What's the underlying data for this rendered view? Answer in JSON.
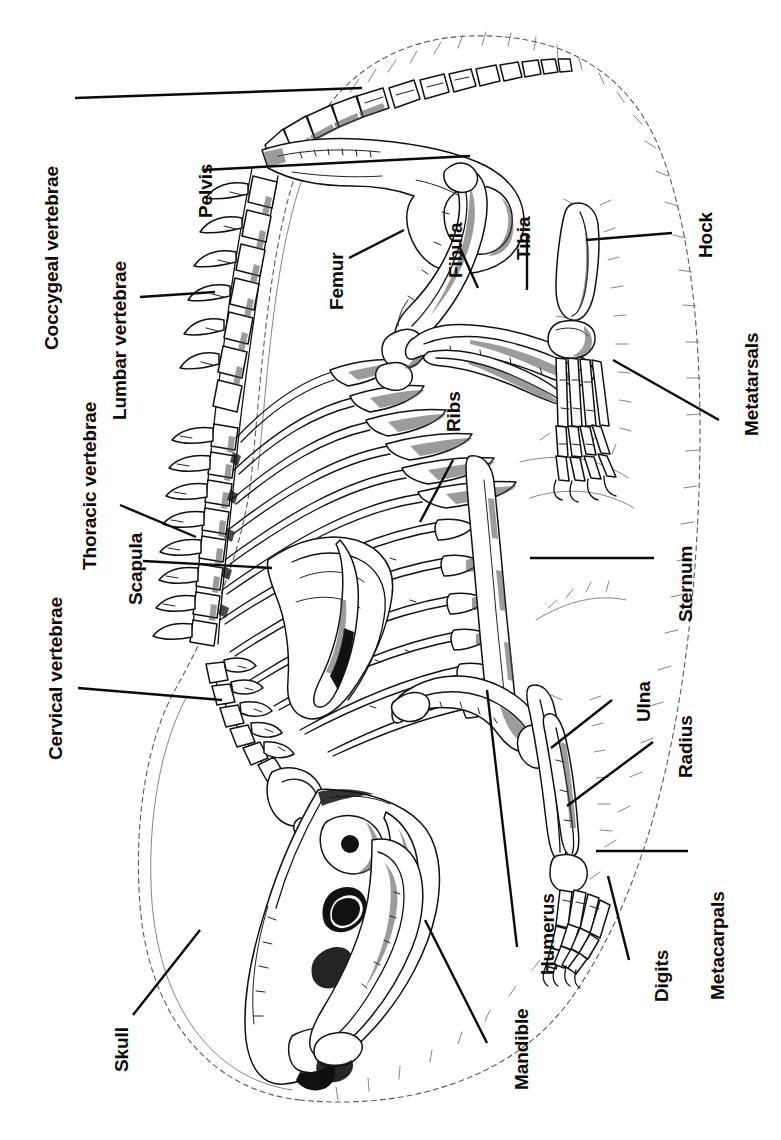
{
  "figure": {
    "view": "lateral",
    "orientation_note": "Labels rendered rotated 90 degrees counter-clockwise",
    "line_color": "#000000",
    "background_color": "#ffffff",
    "label_color": "#0a0a0a"
  },
  "labels": [
    {
      "id": "coccygeal-vertebrae",
      "text": "Coccygeal vertebrae",
      "x": 42,
      "y": 350
    },
    {
      "id": "pelvis",
      "text": "Pelvis",
      "x": 196,
      "y": 218
    },
    {
      "id": "lumbar-vertebrae",
      "text": "Lumbar vertebrae",
      "x": 110,
      "y": 420
    },
    {
      "id": "thoracic-vertebrae",
      "text": "Thoracic vertebrae",
      "x": 80,
      "y": 570
    },
    {
      "id": "scapula",
      "text": "Scapula",
      "x": 126,
      "y": 605
    },
    {
      "id": "cervical-vertebrae",
      "text": "Cervical vertebrae",
      "x": 46,
      "y": 760
    },
    {
      "id": "skull",
      "text": "Skull",
      "x": 112,
      "y": 1072
    },
    {
      "id": "mandible",
      "text": "Mandible",
      "x": 512,
      "y": 1090
    },
    {
      "id": "humerus",
      "text": "Humerus",
      "x": 538,
      "y": 975
    },
    {
      "id": "digits",
      "text": "Digits",
      "x": 652,
      "y": 1002
    },
    {
      "id": "metacarpals",
      "text": "Metacarpals",
      "x": 708,
      "y": 1000
    },
    {
      "id": "radius",
      "text": "Radius",
      "x": 676,
      "y": 778
    },
    {
      "id": "ulna",
      "text": "Ulna",
      "x": 634,
      "y": 722
    },
    {
      "id": "sternum",
      "text": "Sternum",
      "x": 676,
      "y": 622
    },
    {
      "id": "ribs",
      "text": "Ribs",
      "x": 444,
      "y": 432
    },
    {
      "id": "femur",
      "text": "Femur",
      "x": 327,
      "y": 310
    },
    {
      "id": "fibula",
      "text": "Fibula",
      "x": 446,
      "y": 278
    },
    {
      "id": "tibia",
      "text": "Tibia",
      "x": 514,
      "y": 260
    },
    {
      "id": "hock",
      "text": "Hock",
      "x": 696,
      "y": 258
    },
    {
      "id": "metatarsals",
      "text": "Metatarsals",
      "x": 742,
      "y": 436
    }
  ],
  "leader_lines": [
    {
      "id": "leader-coccygeal",
      "x1": 75,
      "y1": 98,
      "x2": 362,
      "y2": 88
    },
    {
      "id": "leader-pelvis",
      "x1": 203,
      "y1": 170,
      "x2": 470,
      "y2": 156
    },
    {
      "id": "leader-lumbar",
      "x1": 140,
      "y1": 297,
      "x2": 215,
      "y2": 292
    },
    {
      "id": "leader-thoracic",
      "x1": 120,
      "y1": 505,
      "x2": 196,
      "y2": 537
    },
    {
      "id": "leader-scapula",
      "x1": 143,
      "y1": 561,
      "x2": 272,
      "y2": 568
    },
    {
      "id": "leader-cervical",
      "x1": 78,
      "y1": 688,
      "x2": 222,
      "y2": 700
    },
    {
      "id": "leader-skull",
      "x1": 133,
      "y1": 1015,
      "x2": 200,
      "y2": 930
    },
    {
      "id": "leader-mandible",
      "x1": 487,
      "y1": 1043,
      "x2": 425,
      "y2": 920
    },
    {
      "id": "leader-humerus",
      "x1": 517,
      "y1": 947,
      "x2": 487,
      "y2": 690
    },
    {
      "id": "leader-digits",
      "x1": 629,
      "y1": 960,
      "x2": 608,
      "y2": 876
    },
    {
      "id": "leader-metacarpals",
      "x1": 688,
      "y1": 851,
      "x2": 596,
      "y2": 851
    },
    {
      "id": "leader-radius",
      "x1": 653,
      "y1": 742,
      "x2": 567,
      "y2": 806
    },
    {
      "id": "leader-ulna",
      "x1": 612,
      "y1": 700,
      "x2": 551,
      "y2": 748
    },
    {
      "id": "leader-sternum",
      "x1": 654,
      "y1": 558,
      "x2": 530,
      "y2": 558
    },
    {
      "id": "leader-ribs",
      "x1": 453,
      "y1": 460,
      "x2": 420,
      "y2": 522
    },
    {
      "id": "leader-femur",
      "x1": 349,
      "y1": 258,
      "x2": 404,
      "y2": 230
    },
    {
      "id": "leader-fibula",
      "x1": 460,
      "y1": 248,
      "x2": 478,
      "y2": 288
    },
    {
      "id": "leader-tibia",
      "x1": 527,
      "y1": 236,
      "x2": 527,
      "y2": 290
    },
    {
      "id": "leader-hock",
      "x1": 672,
      "y1": 233,
      "x2": 586,
      "y2": 240
    },
    {
      "id": "leader-metatarsals",
      "x1": 719,
      "y1": 420,
      "x2": 613,
      "y2": 360
    }
  ],
  "structures": [
    {
      "id": "body-outline",
      "name": "body fur outline"
    },
    {
      "id": "skull-bone",
      "name": "skull"
    },
    {
      "id": "mandible-bone",
      "name": "mandible"
    },
    {
      "id": "cervical-column",
      "name": "cervical vertebrae"
    },
    {
      "id": "thoracic-column",
      "name": "thoracic vertebrae"
    },
    {
      "id": "lumbar-column",
      "name": "lumbar vertebrae"
    },
    {
      "id": "coccygeal-column",
      "name": "coccygeal (tail) vertebrae"
    },
    {
      "id": "pelvis-bone",
      "name": "pelvis with obturator foramen"
    },
    {
      "id": "ribcage",
      "name": "rib cage",
      "rib_count": 12
    },
    {
      "id": "sternum-bone",
      "name": "sternum"
    },
    {
      "id": "scapula-bone",
      "name": "scapula"
    },
    {
      "id": "humerus-bone",
      "name": "humerus"
    },
    {
      "id": "radius-bone",
      "name": "radius"
    },
    {
      "id": "ulna-bone",
      "name": "ulna"
    },
    {
      "id": "metacarpal-bones",
      "name": "metacarpals"
    },
    {
      "id": "fore-digit-bones",
      "name": "fore digits"
    },
    {
      "id": "femur-bone",
      "name": "femur"
    },
    {
      "id": "tibia-bone",
      "name": "tibia"
    },
    {
      "id": "fibula-bone",
      "name": "fibula"
    },
    {
      "id": "hock-bone",
      "name": "hock / tarsus"
    },
    {
      "id": "metatarsal-bones",
      "name": "metatarsals"
    },
    {
      "id": "hind-digit-bones",
      "name": "hind digits"
    }
  ]
}
